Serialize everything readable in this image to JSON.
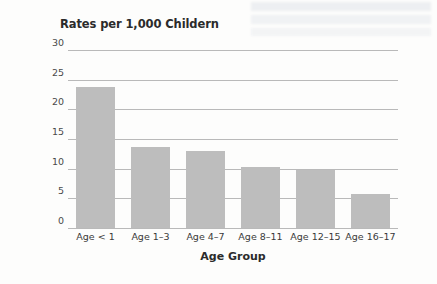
{
  "chart_data": {
    "type": "bar",
    "title": "Rates per 1,000 Childern",
    "xlabel": "Age Group",
    "ylabel": "",
    "categories": [
      "Age < 1",
      "Age 1–3",
      "Age 4–7",
      "Age 8–11",
      "Age 12–15",
      "Age 16–17"
    ],
    "values": [
      23.8,
      13.7,
      13.0,
      10.3,
      9.7,
      5.7
    ],
    "ylim": [
      0,
      30
    ],
    "yticks": [
      0,
      5,
      10,
      15,
      20,
      25,
      30
    ],
    "ytick_labels": [
      "0",
      "5",
      "10",
      "15",
      "20",
      "25",
      "30"
    ],
    "grid": "horizontal",
    "legend": "none",
    "bar_color": "#bdbdbd",
    "gridline_color": "#b9b9b9",
    "background_color": "#fdfdfc"
  }
}
